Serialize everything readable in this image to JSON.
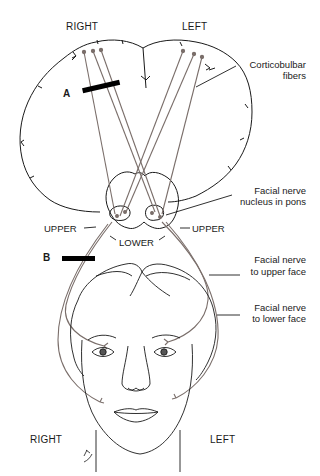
{
  "figure": {
    "title_labels": {
      "top_right_side": "RIGHT",
      "top_left_side": "LEFT",
      "bottom_right_side": "RIGHT",
      "bottom_left_side": "LEFT"
    },
    "lesions": {
      "a": "A",
      "b": "B"
    },
    "pons_labels": {
      "upper_left": "UPPER",
      "upper_right": "UPPER",
      "lower": "LOWER"
    },
    "callouts": {
      "corticobulbar_line1": "Corticobulbar",
      "corticobulbar_line2": "fibers",
      "nucleus_line1": "Facial nerve",
      "nucleus_line2": "nucleus in pons",
      "upper_face_line1": "Facial nerve",
      "upper_face_line2": "to upper face",
      "lower_face_line1": "Facial nerve",
      "lower_face_line2": "to lower face"
    },
    "colors": {
      "outline": "#1a1a1a",
      "nerve": "#7a6e6a",
      "lesion_bar": "#000000",
      "background": "#ffffff"
    }
  }
}
